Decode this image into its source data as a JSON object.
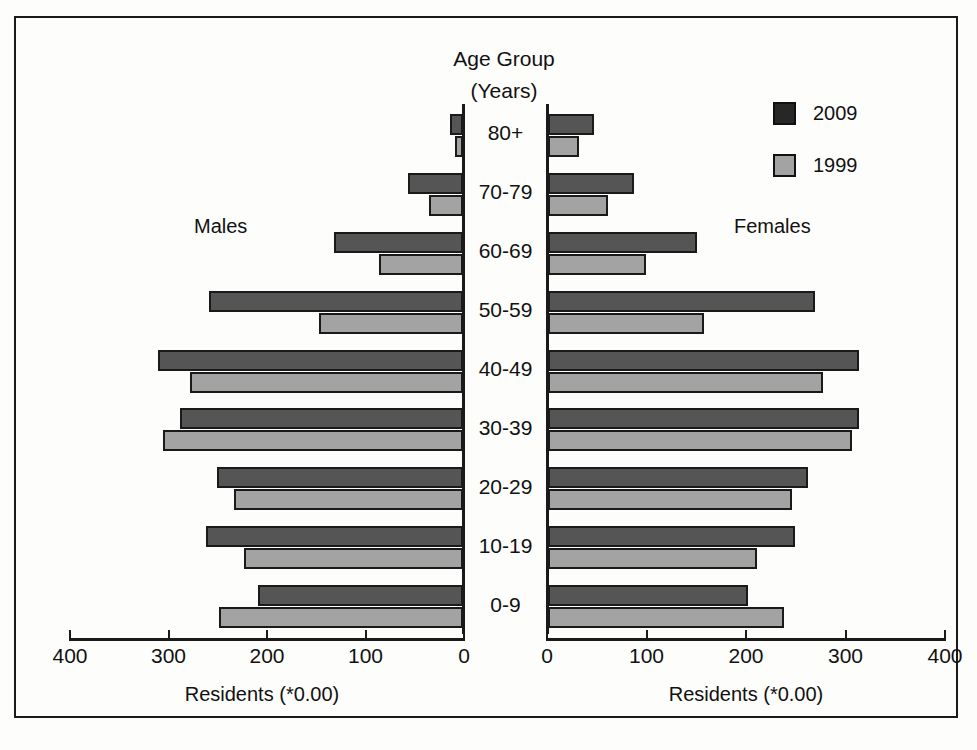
{
  "chart_data": {
    "type": "bar",
    "title": "Age Group",
    "subtitle": "(Years)",
    "xlabel": "Residents (*0.00)",
    "ylabel": "Age Group (Years)",
    "xlim": [
      0,
      400
    ],
    "grid": false,
    "legend_position": "top-right",
    "categories": [
      "80+",
      "70-79",
      "60-69",
      "50-59",
      "40-49",
      "30-39",
      "20-29",
      "10-19",
      "0-9"
    ],
    "left_panel": {
      "label": "Males",
      "axis_caption": "Residents (*0.00)",
      "ticks": [
        400,
        300,
        200,
        100,
        0
      ],
      "tick_labels": [
        "400",
        "300",
        "200",
        "100",
        "0"
      ]
    },
    "right_panel": {
      "label": "Females",
      "axis_caption": "Residents (*0.00)",
      "ticks": [
        0,
        100,
        200,
        300,
        400
      ],
      "tick_labels": [
        "0",
        "100",
        "200",
        "300",
        "400"
      ]
    },
    "series": [
      {
        "name": "2009",
        "color": "#555555",
        "males": [
          13,
          56,
          131,
          258,
          310,
          287,
          250,
          261,
          208
        ],
        "females": [
          46,
          86,
          150,
          268,
          313,
          313,
          261,
          248,
          201
        ]
      },
      {
        "name": "1999",
        "color": "#a3a3a3",
        "males": [
          8,
          35,
          85,
          146,
          277,
          305,
          233,
          222,
          248
        ],
        "females": [
          31,
          60,
          98,
          157,
          276,
          306,
          245,
          210,
          237
        ]
      }
    ]
  },
  "legend": {
    "items": [
      {
        "label": "2009",
        "swatch": "dark-swatch"
      },
      {
        "label": "1999",
        "swatch": "light-swatch"
      }
    ]
  }
}
